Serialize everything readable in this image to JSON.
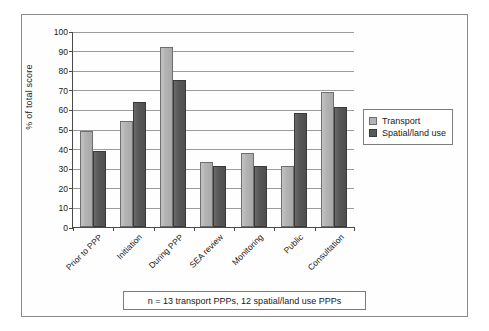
{
  "chart_data": {
    "type": "bar",
    "title": "",
    "xlabel": "",
    "ylabel": "% of total score",
    "ylim": [
      0,
      100
    ],
    "ytick_step": 10,
    "yticks": [
      0,
      10,
      20,
      30,
      40,
      50,
      60,
      70,
      80,
      90,
      100
    ],
    "grid": true,
    "legend_position": "right",
    "categories": [
      "Prior to PPP",
      "Initiation",
      "During PPP",
      "SEA review",
      "Monitoring",
      "Public",
      "Consultation"
    ],
    "series": [
      {
        "name": "Transport",
        "color": "#b3b3b3",
        "values": [
          49,
          54,
          92,
          33,
          38,
          31,
          69
        ]
      },
      {
        "name": "Spatial/land use",
        "color": "#585858",
        "values": [
          39,
          64,
          75,
          31,
          31,
          58,
          61
        ]
      }
    ],
    "annotations": [
      "n = 13 transport PPPs, 12 spatial/land use PPPs"
    ]
  },
  "legend": {
    "entries": [
      {
        "label": "Transport",
        "swatch": "light-gray-swatch"
      },
      {
        "label": "Spatial/land use",
        "swatch": "dark-gray-swatch"
      }
    ]
  },
  "caption": {
    "text": "n = 13 transport PPPs, 12 spatial/land use PPPs"
  },
  "axis": {
    "y_title": "% of total score",
    "y_labels": [
      "100",
      "90",
      "80",
      "70",
      "60",
      "50",
      "40",
      "30",
      "20",
      "10",
      "0"
    ],
    "x_labels": [
      "Prior to PPP",
      "Initiation",
      "During PPP",
      "SEA review",
      "Monitoring",
      "Public",
      "Consultation"
    ]
  }
}
